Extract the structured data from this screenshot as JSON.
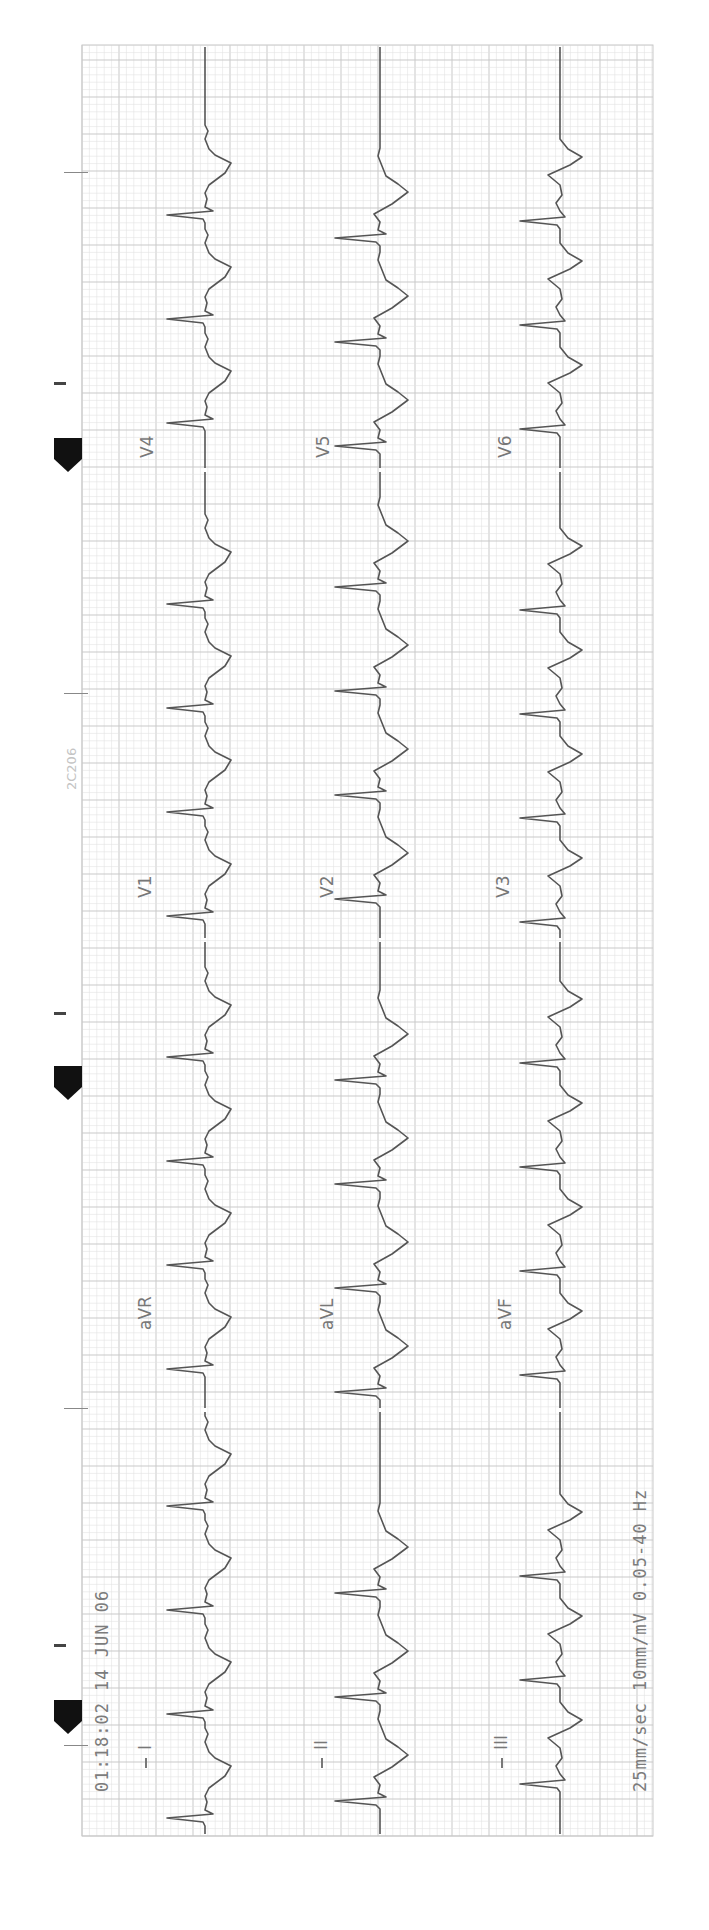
{
  "document": {
    "timestamp": "01:18:02 14 JUN 06",
    "settings": "25mm/sec 10mm/mV 0.05-40 Hz",
    "stamp": "2C206"
  },
  "leads": {
    "col1": [
      "I",
      "aVR",
      "V1",
      "V4"
    ],
    "col2": [
      "II",
      "aVL",
      "V2",
      "V5"
    ],
    "col3": [
      "III",
      "aVF",
      "V3",
      "V6"
    ]
  },
  "lead_labels": {
    "I": "I",
    "II": "II",
    "III": "III",
    "aVR": "aVR",
    "aVL": "aVL",
    "aVF": "aVF",
    "V1": "V1",
    "V2": "V2",
    "V3": "V3",
    "V4": "V4",
    "V5": "V5",
    "V6": "V6"
  },
  "grid": {
    "left": 82,
    "top": 45,
    "right": 653,
    "bottom": 1836,
    "minor": 7.4,
    "major": 37,
    "minor_color": "#e3e3e3",
    "major_color": "#c9c9c9"
  },
  "trace": {
    "color": "#555555",
    "baselines": [
      205,
      380,
      560
    ],
    "beat_interval": 104,
    "first_beat_y": 1800,
    "segments": [
      {
        "label_key": "I_col",
        "from": 1836,
        "to": 1410
      },
      {
        "from": 1410,
        "to": 940
      },
      {
        "from": 940,
        "to": 470
      },
      {
        "from": 470,
        "to": 45
      }
    ]
  },
  "markers": [
    {
      "dash_y": 383,
      "pent_y": 438
    },
    {
      "dash_y": 1013,
      "pent_y": 1066
    },
    {
      "dash_y": 1645,
      "pent_y": 1700
    }
  ]
}
